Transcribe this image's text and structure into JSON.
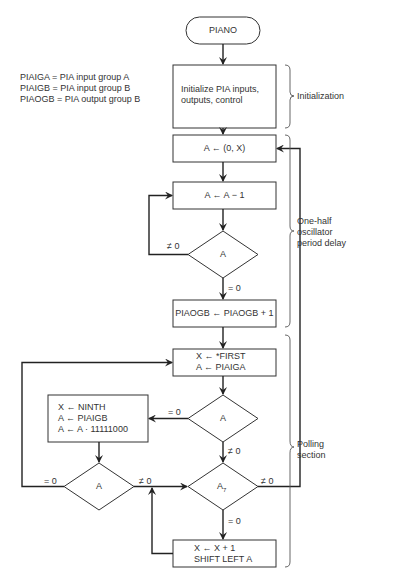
{
  "legend": [
    "PIAIGA = PIA input group A",
    "PIAIGB = PIA input group B",
    "PIAOGB = PIA output group B"
  ],
  "nodes": {
    "start": "PIANO",
    "init_line1": "Initialize PIA inputs,",
    "init_line2": "outputs, control",
    "load_a": "A ← (0, X)",
    "dec_a": "A ← A − 1",
    "test_a1": "A",
    "inc_out": "PIAOGB ← PIAOGB + 1",
    "first_line1": "X ← *FIRST",
    "first_line2": "A ← PIAIGA",
    "test_a2": "A",
    "ninth_line1": "X ← NINTH",
    "ninth_line2": "A ← PIAIGB",
    "ninth_line3": "A ← A · 11111000",
    "test_a3": "A",
    "test_a7": "A",
    "test_a7_sub": "7",
    "shift_line1": "X ← X + 1",
    "shift_line2": "SHIFT LEFT A"
  },
  "edge_labels": {
    "a1_ne0": "≠ 0",
    "a1_eq0": "= 0",
    "a2_eq0": "= 0",
    "a2_ne0": "≠ 0",
    "a3_eq0": "= 0",
    "a3_ne0": "≠ 0",
    "a7_ne0": "≠ 0",
    "a7_eq0": "= 0"
  },
  "sections": {
    "initialization": "Initialization",
    "delay_line1": "One-half",
    "delay_line2": "oscillator",
    "delay_line3": "period delay",
    "polling_line1": "Polling",
    "polling_line2": "section"
  }
}
